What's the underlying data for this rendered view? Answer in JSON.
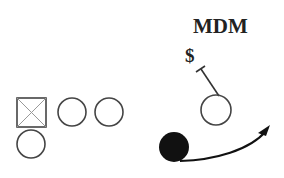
{
  "diagram": {
    "title": "MDM",
    "marker_label": "$",
    "colors": {
      "background": "#ffffff",
      "stroke": "#333333",
      "fill_dark": "#111111",
      "square_cross": "#888888"
    },
    "players": [
      {
        "id": "center-square",
        "shape": "square-x",
        "cx": 31,
        "cy": 112,
        "size": 29
      },
      {
        "id": "left-circle-2",
        "shape": "circle",
        "cx": 72,
        "cy": 112,
        "r": 14
      },
      {
        "id": "left-circle-3",
        "shape": "circle",
        "cx": 109,
        "cy": 112,
        "r": 14
      },
      {
        "id": "bottom-circle",
        "shape": "circle",
        "cx": 31,
        "cy": 144,
        "r": 14
      },
      {
        "id": "right-circle",
        "shape": "circle",
        "cx": 216,
        "cy": 110,
        "r": 15
      },
      {
        "id": "ball-carrier",
        "shape": "filled-circle",
        "cx": 174,
        "cy": 147,
        "r": 15
      }
    ]
  }
}
